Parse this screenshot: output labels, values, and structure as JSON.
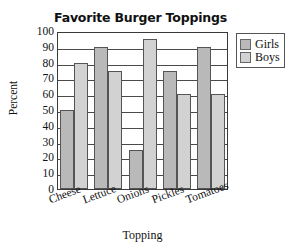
{
  "chart_data": {
    "type": "bar",
    "title": "Favorite Burger Toppings",
    "xlabel": "Topping",
    "ylabel": "Percent",
    "categories": [
      "Cheese",
      "Lettuce",
      "Onions",
      "Pickles",
      "Tomatoes"
    ],
    "series": [
      {
        "name": "Girls",
        "color": "#b9b9b9",
        "values": [
          50,
          90,
          25,
          75,
          90
        ]
      },
      {
        "name": "Boys",
        "color": "#d2d2d2",
        "values": [
          80,
          75,
          95,
          60,
          60
        ]
      }
    ],
    "ylim": [
      0,
      100
    ],
    "yticks": [
      100,
      90,
      80,
      70,
      60,
      50,
      40,
      30,
      20,
      10,
      0
    ],
    "grid": "horizontal",
    "legend_position": "right-top",
    "legend_entries": [
      "Girls",
      "Boys"
    ]
  }
}
